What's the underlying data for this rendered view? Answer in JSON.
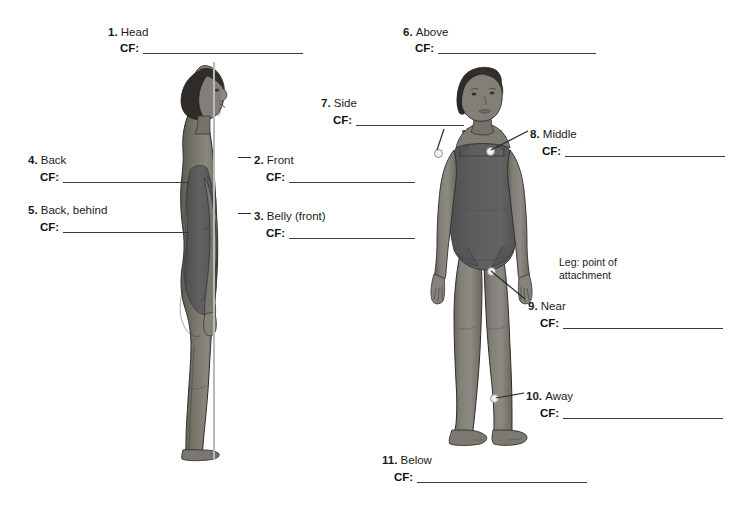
{
  "page": {
    "background": "#ffffff",
    "cf_prefix": "CF:",
    "annotation": {
      "line1": "Leg: point of",
      "line2": "attachment"
    }
  },
  "palette": {
    "skin": "#7d7a75",
    "skin_shadow": "#626059",
    "skin_light": "#93908a",
    "hair": "#2e2b28",
    "leotard": "#595959",
    "leotard_dark": "#4a4a4a",
    "outline": "#2b2b2b",
    "reference_line": "#b9b9b9",
    "dot_fill": "#efefef",
    "text": "#1b1b1b"
  },
  "labels": [
    {
      "id": 1,
      "num": "1.",
      "text": "Head",
      "x": 108,
      "y": 28,
      "cf_x": 120,
      "cf_y": 47,
      "blank": 160
    },
    {
      "id": 2,
      "num": "2.",
      "text": "Front",
      "x": 254,
      "y": 152,
      "cf_x": 266,
      "cf_y": 175,
      "blank": 126
    },
    {
      "id": 3,
      "num": "3.",
      "text": "Belly (front)",
      "x": 254,
      "y": 208,
      "cf_x": 266,
      "cf_y": 231,
      "blank": 126
    },
    {
      "id": 4,
      "num": "4.",
      "text": "Back",
      "x": 28,
      "y": 152,
      "cf_x": 40,
      "cf_y": 175,
      "blank": 126
    },
    {
      "id": 5,
      "num": "5.",
      "text": "Back, behind",
      "x": 28,
      "y": 202,
      "cf_x": 40,
      "cf_y": 225,
      "blank": 126
    },
    {
      "id": 6,
      "num": "6.",
      "text": "Above",
      "x": 403,
      "y": 28,
      "cf_x": 415,
      "cf_y": 47,
      "blank": 158
    },
    {
      "id": 7,
      "num": "7.",
      "text": "Side",
      "x": 321,
      "y": 95,
      "cf_x": 333,
      "cf_y": 118,
      "blank": 108
    },
    {
      "id": 8,
      "num": "8.",
      "text": "Middle",
      "x": 530,
      "y": 126,
      "cf_x": 542,
      "cf_y": 149,
      "blank": 160
    },
    {
      "id": 9,
      "num": "9.",
      "text": "Near",
      "x": 528,
      "y": 298,
      "cf_x": 540,
      "cf_y": 321,
      "blank": 160
    },
    {
      "id": 10,
      "num": "10.",
      "text": "Away",
      "x": 526,
      "y": 388,
      "cf_x": 540,
      "cf_y": 411,
      "blank": 160
    },
    {
      "id": 11,
      "num": "11.",
      "text": "Below",
      "x": 382,
      "y": 452,
      "cf_x": 394,
      "cf_y": 473,
      "blank": 170
    }
  ],
  "annotation_pos": {
    "x": 559,
    "y": 259
  },
  "figures": {
    "side_view": {
      "name": "side-view-female-figure",
      "x": 168,
      "y": 62,
      "width": 96,
      "height": 398
    },
    "front_view": {
      "name": "front-view-female-figure",
      "x": 405,
      "y": 60,
      "width": 152,
      "height": 378
    }
  },
  "markers": [
    {
      "for": 7,
      "name": "shoulder-marker",
      "x": 437,
      "y": 152
    },
    {
      "for": 8,
      "name": "chest-marker",
      "x": 489,
      "y": 150
    },
    {
      "for": 9,
      "name": "thigh-marker",
      "x": 490,
      "y": 270
    },
    {
      "for": 10,
      "name": "ankle-marker",
      "x": 493,
      "y": 397
    }
  ]
}
